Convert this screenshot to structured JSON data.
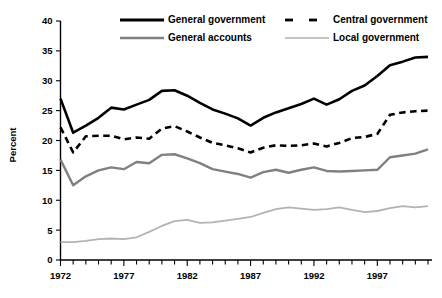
{
  "chart_data": {
    "type": "line",
    "title": "",
    "subtitle": "",
    "xlabel": "",
    "ylabel": "Percent",
    "xlim": [
      1972,
      2001
    ],
    "ylim": [
      0,
      40
    ],
    "ytick_step": 5,
    "yticks": [
      0,
      5,
      10,
      15,
      20,
      25,
      30,
      35,
      40
    ],
    "ytick_labels": [
      "0",
      "5",
      "10",
      "15",
      "20",
      "25",
      "30",
      "35",
      "40"
    ],
    "xticks": [
      1972,
      1977,
      1982,
      1987,
      1992,
      1997
    ],
    "xtick_labels": [
      "1972",
      "1977",
      "1982",
      "1987",
      "1992",
      "1997"
    ],
    "x_minor_tick_interval": 1,
    "grid": false,
    "legend_position": "top-center",
    "x": [
      1972,
      1973,
      1974,
      1975,
      1976,
      1977,
      1978,
      1979,
      1980,
      1981,
      1982,
      1983,
      1984,
      1985,
      1986,
      1987,
      1988,
      1989,
      1990,
      1991,
      1992,
      1993,
      1994,
      1995,
      1996,
      1997,
      1998,
      1999,
      2000,
      2001
    ],
    "series": [
      {
        "name": "General government",
        "color": "#000000",
        "style": "solid",
        "width": 2.6,
        "values": [
          27.0,
          21.3,
          22.5,
          23.8,
          25.5,
          25.2,
          26.0,
          26.8,
          28.3,
          28.4,
          27.5,
          26.3,
          25.2,
          24.5,
          23.7,
          22.5,
          23.8,
          24.7,
          25.4,
          26.1,
          27.0,
          26.0,
          26.9,
          28.3,
          29.2,
          30.8,
          32.6,
          33.2,
          33.9,
          34.0
        ]
      },
      {
        "name": "Central government",
        "color": "#000000",
        "style": "dashed",
        "width": 2.6,
        "values": [
          22.2,
          18.0,
          20.7,
          20.8,
          20.8,
          20.2,
          20.5,
          20.3,
          22.0,
          22.4,
          21.5,
          20.5,
          19.6,
          19.2,
          18.7,
          18.0,
          18.8,
          19.2,
          19.1,
          19.2,
          19.5,
          19.0,
          19.6,
          20.4,
          20.6,
          21.1,
          24.3,
          24.7,
          24.9,
          25.0
        ]
      },
      {
        "name": "General accounts",
        "color": "#808080",
        "style": "solid",
        "width": 2.4,
        "values": [
          16.8,
          12.5,
          14.0,
          15.0,
          15.5,
          15.2,
          16.4,
          16.2,
          17.6,
          17.7,
          17.0,
          16.2,
          15.2,
          14.8,
          14.4,
          13.8,
          14.7,
          15.1,
          14.6,
          15.1,
          15.5,
          14.9,
          14.8,
          14.9,
          15.0,
          15.1,
          17.2,
          17.5,
          17.8,
          18.5
        ]
      },
      {
        "name": "Local government",
        "color": "#b3b3b3",
        "style": "solid",
        "width": 1.8,
        "values": [
          3.0,
          3.0,
          3.2,
          3.5,
          3.6,
          3.5,
          3.8,
          4.7,
          5.7,
          6.5,
          6.7,
          6.2,
          6.3,
          6.6,
          6.9,
          7.2,
          7.9,
          8.5,
          8.8,
          8.6,
          8.4,
          8.5,
          8.8,
          8.4,
          8.0,
          8.2,
          8.7,
          9.0,
          8.8,
          9.0
        ]
      }
    ]
  },
  "legend": {
    "entries": [
      {
        "label": "General government",
        "color": "#000000",
        "style": "solid"
      },
      {
        "label": "Central government",
        "color": "#000000",
        "style": "dashed"
      },
      {
        "label": "General accounts",
        "color": "#808080",
        "style": "solid"
      },
      {
        "label": "Local government",
        "color": "#b3b3b3",
        "style": "solid"
      }
    ]
  },
  "axis": {
    "y_title": "Percent"
  }
}
